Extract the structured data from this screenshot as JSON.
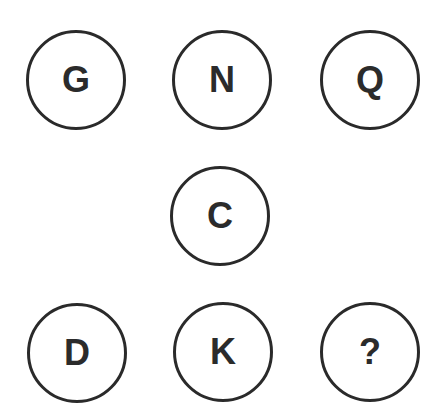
{
  "puzzle": {
    "circles": [
      {
        "label": "G",
        "position": "top-left"
      },
      {
        "label": "N",
        "position": "top-center"
      },
      {
        "label": "Q",
        "position": "top-right"
      },
      {
        "label": "C",
        "position": "middle-center"
      },
      {
        "label": "D",
        "position": "bottom-left"
      },
      {
        "label": "K",
        "position": "bottom-center"
      },
      {
        "label": "?",
        "position": "bottom-right"
      }
    ]
  }
}
